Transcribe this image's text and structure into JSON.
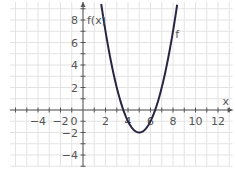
{
  "chart_data": {
    "type": "line",
    "title": "",
    "xlabel": "x",
    "ylabel": "f(x)",
    "series": [
      {
        "name": "f",
        "function": "(x-5)^2-2",
        "color": "#2a2445",
        "x": [
          1.6,
          2,
          3,
          3.59,
          4,
          5,
          6,
          6.41,
          7,
          8,
          8.4
        ],
        "y": [
          9.56,
          7,
          2,
          0,
          -1,
          -2,
          -1,
          0,
          2,
          7,
          9.56
        ]
      }
    ],
    "x_ticks": [
      -4,
      -2,
      0,
      2,
      4,
      6,
      8,
      10,
      12
    ],
    "y_ticks": [
      -4,
      -2,
      2,
      4,
      6,
      8
    ],
    "xlim": [
      -6.5,
      13.5
    ],
    "ylim": [
      -5,
      9.5
    ],
    "grid": true,
    "curve_label": "f"
  },
  "labels": {
    "x_axis": "x",
    "y_axis": "f(x)",
    "curve": "f",
    "origin": "0"
  }
}
